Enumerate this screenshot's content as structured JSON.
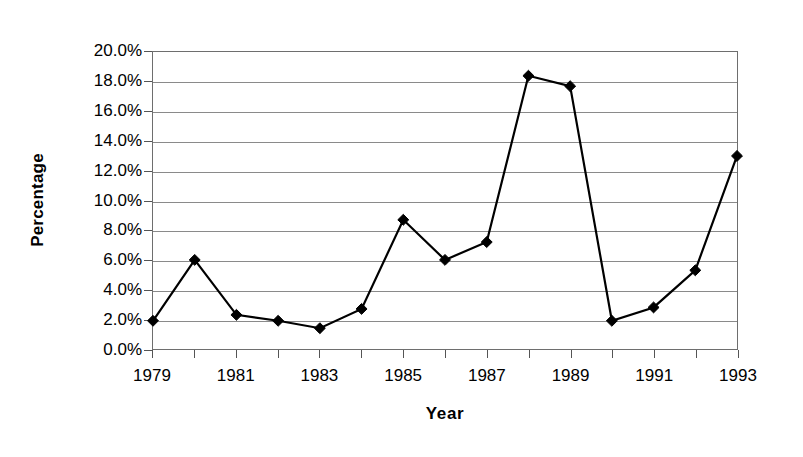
{
  "chart_data": {
    "type": "line",
    "title": "",
    "xlabel": "Year",
    "ylabel": "Percentage",
    "x": [
      1979,
      1980,
      1981,
      1982,
      1983,
      1984,
      1985,
      1986,
      1987,
      1988,
      1989,
      1990,
      1991,
      1992,
      1993
    ],
    "values": [
      1.9,
      6.0,
      2.3,
      1.9,
      1.4,
      2.7,
      8.7,
      6.0,
      7.2,
      18.4,
      17.7,
      1.9,
      2.8,
      5.3,
      13.0
    ],
    "series": [
      {
        "name": "Percentage",
        "values": [
          1.9,
          6.0,
          2.3,
          1.9,
          1.4,
          2.7,
          8.7,
          6.0,
          7.2,
          18.4,
          17.7,
          1.9,
          2.8,
          5.3,
          13.0
        ]
      }
    ],
    "ylim": [
      0,
      20
    ],
    "xlim": [
      1979,
      1993
    ],
    "ytick_values": [
      0,
      2,
      4,
      6,
      8,
      10,
      12,
      14,
      16,
      18,
      20
    ],
    "ytick_labels": [
      "0.0%",
      "2.0%",
      "4.0%",
      "6.0%",
      "8.0%",
      "10.0%",
      "12.0%",
      "14.0%",
      "16.0%",
      "18.0%",
      "20.0%"
    ],
    "xtick_values": [
      1979,
      1981,
      1983,
      1985,
      1987,
      1989,
      1991,
      1993
    ],
    "xtick_labels": [
      "1979",
      "1981",
      "1983",
      "1985",
      "1987",
      "1989",
      "1991",
      "1993"
    ],
    "xtick_minor_values": [
      1980,
      1982,
      1984,
      1986,
      1988,
      1990,
      1992
    ],
    "grid": true,
    "grid_axis": "y",
    "legend": false,
    "legend_position": "none",
    "marker": "diamond",
    "marker_color": "#000000",
    "line_color": "#000000",
    "line_width": 2.2,
    "marker_size": 11,
    "grid_color": "#8a8a8a",
    "axis_color": "#6e6e6e",
    "background_color": "#ffffff"
  },
  "axis": {
    "y_title": "Percentage",
    "x_title": "Year"
  }
}
